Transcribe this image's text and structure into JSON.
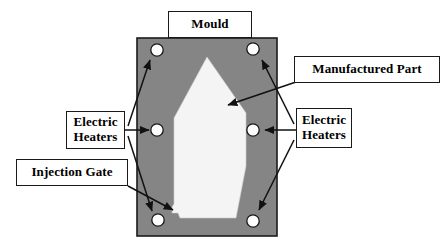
{
  "figure": {
    "background_color": "#ffffff"
  },
  "colors": {
    "mould_body": "#858585",
    "part_fill": "#f4f4f4",
    "outline": "#1a1a1a",
    "hole_fill": "#ffffff",
    "box_background": "#ffffff",
    "text": "#000000"
  },
  "labels": {
    "mould": "Mould",
    "manufactured_part": "Manufactured Part",
    "electric_heaters_left": "Electric\nHeaters",
    "electric_heaters_right": "Electric\nHeaters",
    "injection_gate": "Injection Gate"
  },
  "diagram": {
    "mould_block": {
      "name": "Mould",
      "x": 137,
      "y": 38,
      "width": 140,
      "height": 198
    },
    "manufactured_part": {
      "name": "Manufactured Part",
      "shape": "pentagon",
      "apex": [
        207,
        57
      ]
    },
    "injection_gate": {
      "name": "Injection Gate",
      "position": [
        172,
        215
      ]
    },
    "electric_heaters": [
      {
        "id": "heater-top-left",
        "cx": 157,
        "cy": 50,
        "r": 6
      },
      {
        "id": "heater-top-right",
        "cx": 253,
        "cy": 49,
        "r": 6
      },
      {
        "id": "heater-mid-left",
        "cx": 157,
        "cy": 130,
        "r": 6
      },
      {
        "id": "heater-mid-right",
        "cx": 253,
        "cy": 130,
        "r": 6
      },
      {
        "id": "heater-bottom-left",
        "cx": 158,
        "cy": 220,
        "r": 6
      },
      {
        "id": "heater-bottom-right",
        "cx": 253,
        "cy": 221,
        "r": 6
      }
    ],
    "leader_count": 7
  }
}
